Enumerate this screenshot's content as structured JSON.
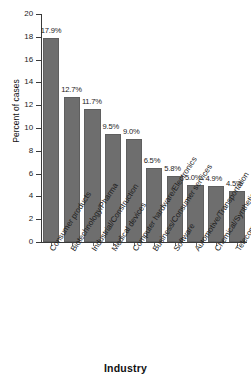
{
  "chart_data": {
    "type": "bar",
    "title": "",
    "xlabel": "Industry",
    "ylabel": "Percent of cases",
    "ylim": [
      0,
      20
    ],
    "grid": false,
    "legend": "none",
    "yticks": [
      0,
      2,
      4,
      6,
      8,
      10,
      12,
      14,
      16,
      18,
      20
    ],
    "ytick_labels": [
      "0",
      "2",
      "4",
      "6",
      "8",
      "10",
      "12",
      "14",
      "16",
      "18",
      "20"
    ],
    "categories": [
      "Consumer products",
      "Biotechnology/Pharma",
      "Industrial/Construction",
      "Medical devices",
      "Computer hardware/Electronics",
      "Business/Consumer services",
      "Software",
      "Automotive/Transportation",
      "Chemical/Synthetic materials",
      "Telecommunications"
    ],
    "values": [
      17.9,
      12.7,
      11.7,
      9.5,
      9.0,
      6.5,
      5.8,
      5.0,
      4.9,
      4.5
    ],
    "data_labels": [
      "17.9%",
      "12.7%",
      "11.7%",
      "9.5%",
      "9.0%",
      "6.5%",
      "5.8%",
      "5.0%",
      "4.9%",
      "4.5%"
    ],
    "bar_color": "#6e6e6e",
    "axis_color": "#3a3a3a",
    "background_color": "#ffffff",
    "text_color": "#1b1b1b"
  }
}
